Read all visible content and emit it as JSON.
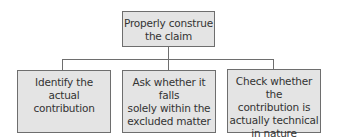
{
  "diagram": {
    "type": "tree",
    "root": {
      "label": "Properly construe the claim",
      "line1": "Properly construe",
      "line2": "the claim"
    },
    "children": [
      {
        "label": "Identify the actual contribution",
        "line1": "Identify the actual",
        "line2": "contribution"
      },
      {
        "label": "Ask whether it falls solely within the excluded matter",
        "line1": "Ask whether it falls",
        "line2": "solely within the",
        "line3": "excluded matter"
      },
      {
        "label": "Check whether the contribution is actually technical in nature",
        "line1": "Check whether the",
        "line2": "contribution is",
        "line3": "actually technical",
        "line4": "in nature"
      }
    ],
    "colors": {
      "box_fill": "#e4e4e4",
      "box_border": "#6e6e6e",
      "connector": "#6e6e6e",
      "text": "#333333"
    }
  }
}
